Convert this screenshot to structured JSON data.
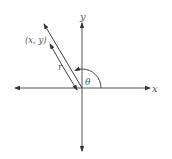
{
  "diagram": {
    "type": "polar-coordinate-angle",
    "labels": {
      "x_axis": "x",
      "y_axis": "y",
      "point": "(x, y)",
      "radius": "r",
      "angle": "θ"
    },
    "colors": {
      "stroke": "#444444",
      "text": "#555555",
      "background": "#ffffff"
    }
  }
}
